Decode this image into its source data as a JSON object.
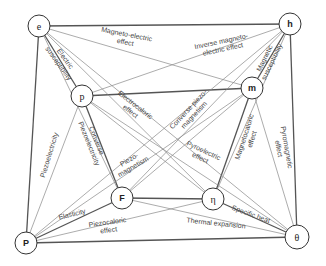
{
  "diagram": {
    "nodes": [
      {
        "id": "e",
        "label": "e",
        "x": 39,
        "y": 26,
        "r": 11,
        "sans": false
      },
      {
        "id": "h",
        "label": "h",
        "x": 290,
        "y": 24,
        "r": 11,
        "sans": true
      },
      {
        "id": "p",
        "label": "p",
        "x": 82,
        "y": 96,
        "r": 11,
        "sans": false
      },
      {
        "id": "m",
        "label": "m",
        "x": 252,
        "y": 88,
        "r": 11,
        "sans": true
      },
      {
        "id": "F",
        "label": "F",
        "x": 122,
        "y": 198,
        "r": 11,
        "sans": true
      },
      {
        "id": "eta",
        "label": "η",
        "x": 213,
        "y": 199,
        "r": 11,
        "sans": false
      },
      {
        "id": "P",
        "label": "P",
        "x": 26,
        "y": 243,
        "r": 11,
        "sans": true
      },
      {
        "id": "theta",
        "label": "θ",
        "x": 297,
        "y": 237,
        "r": 12,
        "sans": false
      }
    ],
    "edges": [
      {
        "from": "e",
        "to": "h",
        "style": "thick"
      },
      {
        "from": "e",
        "to": "P",
        "style": "thick"
      },
      {
        "from": "h",
        "to": "theta",
        "style": "thick"
      },
      {
        "from": "P",
        "to": "theta",
        "style": "thick"
      },
      {
        "from": "e",
        "to": "p",
        "style": "thick"
      },
      {
        "from": "h",
        "to": "m",
        "style": "thick"
      },
      {
        "from": "P",
        "to": "F",
        "style": "thick"
      },
      {
        "from": "theta",
        "to": "eta",
        "style": "thick"
      },
      {
        "from": "p",
        "to": "m",
        "style": "thick"
      },
      {
        "from": "F",
        "to": "eta",
        "style": "thick"
      },
      {
        "from": "p",
        "to": "F",
        "style": "thick"
      },
      {
        "from": "m",
        "to": "eta",
        "style": "thick"
      },
      {
        "from": "e",
        "to": "m",
        "style": "thin"
      },
      {
        "from": "h",
        "to": "p",
        "style": "thin"
      },
      {
        "from": "e",
        "to": "F",
        "style": "thin"
      },
      {
        "from": "e",
        "to": "eta",
        "style": "thin"
      },
      {
        "from": "e",
        "to": "theta",
        "style": "thin"
      },
      {
        "from": "p",
        "to": "P",
        "style": "thin"
      },
      {
        "from": "p",
        "to": "eta",
        "style": "thin"
      },
      {
        "from": "p",
        "to": "theta",
        "style": "thin"
      },
      {
        "from": "h",
        "to": "F",
        "style": "thin"
      },
      {
        "from": "h",
        "to": "eta",
        "style": "thin"
      },
      {
        "from": "h",
        "to": "P",
        "style": "thin"
      },
      {
        "from": "m",
        "to": "F",
        "style": "thin"
      },
      {
        "from": "m",
        "to": "P",
        "style": "thin"
      },
      {
        "from": "m",
        "to": "theta",
        "style": "thin"
      },
      {
        "from": "F",
        "to": "theta",
        "style": "thin"
      },
      {
        "from": "P",
        "to": "eta",
        "style": "thin"
      }
    ],
    "edge_labels": [
      {
        "lines": [
          "Magneto-electric",
          "effect"
        ],
        "x": 126,
        "y": 38,
        "angle": 11
      },
      {
        "lines": [
          "Inverse magneto-",
          "electric effect"
        ],
        "x": 222,
        "y": 45,
        "angle": -12
      },
      {
        "lines": [
          "Electric",
          "susceptibility"
        ],
        "x": 62,
        "y": 61,
        "angle": 54
      },
      {
        "lines": [
          "Magnetic",
          "susceptibility"
        ],
        "x": 268,
        "y": 60,
        "angle": -64
      },
      {
        "lines": [
          "Electrocaloric",
          "effect"
        ],
        "x": 133,
        "y": 108,
        "angle": 38
      },
      {
        "lines": [
          "Converse piezo-",
          "magnetism"
        ],
        "x": 191,
        "y": 112,
        "angle": -47
      },
      {
        "lines": [
          "Converse",
          "Piezoelectricity"
        ],
        "x": 93,
        "y": 142,
        "angle": 68
      },
      {
        "lines": [
          "Piezoelectricity"
        ],
        "x": 49,
        "y": 155,
        "angle": -73
      },
      {
        "lines": [
          "Piezo-",
          "magnetism"
        ],
        "x": 131,
        "y": 163,
        "angle": -30
      },
      {
        "lines": [
          "Pyroelectric",
          "effect"
        ],
        "x": 202,
        "y": 154,
        "angle": 25
      },
      {
        "lines": [
          "Magnetocaloric",
          "effect"
        ],
        "x": 248,
        "y": 138,
        "angle": -72
      },
      {
        "lines": [
          "Pyromagnetic",
          "effect"
        ],
        "x": 283,
        "y": 148,
        "angle": 80
      },
      {
        "lines": [
          "Elasticity"
        ],
        "x": 72,
        "y": 214,
        "angle": -14
      },
      {
        "lines": [
          "Piezocaloric",
          "effect"
        ],
        "x": 108,
        "y": 226,
        "angle": -8
      },
      {
        "lines": [
          "Specific heat"
        ],
        "x": 251,
        "y": 214,
        "angle": 20
      },
      {
        "lines": [
          "Thermal expansion"
        ],
        "x": 216,
        "y": 223,
        "angle": 6
      }
    ]
  }
}
